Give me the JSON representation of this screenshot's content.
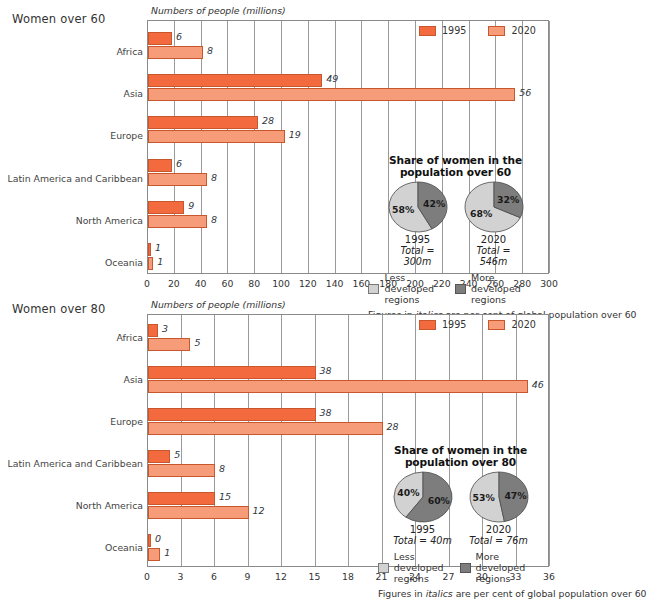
{
  "charts": [
    {
      "panel_title": "Women over 60",
      "axis_title": "Numbers of people (millions)",
      "legend": {
        "s1995": "1995",
        "s2020": "2020"
      },
      "footnote_pre": "Figures in ",
      "footnote_em": "italics",
      "footnote_post": " are per cent of global population over 60",
      "inset": {
        "title_line1": "Share of women in the",
        "title_line2": "population over 60",
        "pies": [
          {
            "year": "1995",
            "total": "Total = 300m",
            "less": 58,
            "more": 42,
            "less_label": "58%",
            "more_label": "42%"
          },
          {
            "year": "2020",
            "total": "Total = 546m",
            "less": 68,
            "more": 32,
            "less_label": "68%",
            "more_label": "32%"
          }
        ],
        "key_less": "Less developed regions",
        "key_more": "More developed regions"
      },
      "chart_data": {
        "type": "bar",
        "title": "Women over 60",
        "xlabel": "Numbers of people (millions)",
        "ylabel": "",
        "xlim": [
          0,
          300
        ],
        "xticks": [
          0,
          20,
          40,
          60,
          80,
          100,
          120,
          140,
          160,
          180,
          200,
          220,
          240,
          260,
          280,
          300
        ],
        "grid": true,
        "legend_position": "top-right",
        "orientation": "horizontal",
        "categories": [
          "Africa",
          "Asia",
          "Europe",
          "Latin America and Caribbean",
          "North America",
          "Oceania"
        ],
        "series": [
          {
            "name": "1995",
            "values": [
              18,
              130,
              82,
              18,
              27,
              2
            ],
            "color": "#f26a3d"
          },
          {
            "name": "2020",
            "values": [
              41,
              274,
              102,
              44,
              44,
              4
            ],
            "color": "#f79c78"
          }
        ],
        "data_labels": {
          "1995": [
            "6",
            "49",
            "28",
            "6",
            "9",
            "1"
          ],
          "2020": [
            "8",
            "56",
            "19",
            "8",
            "8",
            "1"
          ]
        },
        "data_label_note": "italic labels are per cent of global population over 60"
      }
    },
    {
      "panel_title": "Women over 80",
      "axis_title": "Numbers of people (millions)",
      "legend": {
        "s1995": "1995",
        "s2020": "2020"
      },
      "footnote_pre": "Figures in ",
      "footnote_em": "italics",
      "footnote_post": " are per cent of global population over 60",
      "inset": {
        "title_line1": "Share of women in the",
        "title_line2": "population over 80",
        "pies": [
          {
            "year": "1995",
            "total": "Total = 40m",
            "less": 40,
            "more": 60,
            "less_label": "40%",
            "more_label": "60%"
          },
          {
            "year": "2020",
            "total": "Total = 76m",
            "less": 53,
            "more": 47,
            "less_label": "53%",
            "more_label": "47%"
          }
        ],
        "key_less": "Less developed regions",
        "key_more": "More developed regions"
      },
      "chart_data": {
        "type": "bar",
        "title": "Women over 80",
        "xlabel": "Numbers of people (millions)",
        "ylabel": "",
        "xlim": [
          0,
          36
        ],
        "xticks": [
          0,
          3,
          6,
          9,
          12,
          15,
          18,
          21,
          24,
          27,
          30,
          33,
          36
        ],
        "grid": true,
        "legend_position": "top-right",
        "orientation": "horizontal",
        "categories": [
          "Africa",
          "Asia",
          "Europe",
          "Latin America and Caribbean",
          "North America",
          "Oceania"
        ],
        "series": [
          {
            "name": "1995",
            "values": [
              0.9,
              15,
              15,
              2,
              6,
              0.1
            ],
            "color": "#f26a3d"
          },
          {
            "name": "2020",
            "values": [
              3.8,
              34,
              21,
              6,
              9,
              1.1
            ],
            "color": "#f79c78"
          }
        ],
        "data_labels": {
          "1995": [
            "3",
            "38",
            "38",
            "5",
            "15",
            "0"
          ],
          "2020": [
            "5",
            "46",
            "28",
            "8",
            "12",
            "1"
          ]
        },
        "data_label_note": "italic labels are per cent of global population over 60"
      }
    }
  ],
  "colors": {
    "series_1995": "#f26a3d",
    "series_2020": "#f79c78",
    "bar_outline": "#c9572e",
    "less_developed": "#d2d2d2",
    "more_developed": "#7d7d7d",
    "grid": "#9a9a9a"
  }
}
